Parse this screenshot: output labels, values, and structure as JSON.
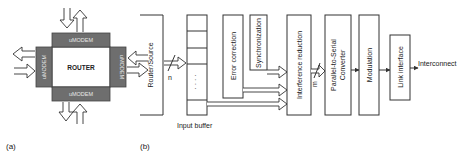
{
  "panel_a": {
    "label": "(a)",
    "router": "ROUTER",
    "modems": {
      "top": "uMODEM",
      "bottom": "uMODEM",
      "left": "uMODEM",
      "right": "uMODEM"
    }
  },
  "panel_b": {
    "label": "(b)",
    "source": "Router/Source",
    "bus_width_in": "n",
    "input_buffer": "Input buffer",
    "buffer_dots": "· · · ·",
    "blocks": {
      "error_correction": "Error correction",
      "synchronization": "Synchronization",
      "interference_reduction": "Interference reduction",
      "p2s": "Parallel-to-Serial",
      "p2s_2": "Converter",
      "modulation": "Modulation",
      "link_interface": "Link interface"
    },
    "bus_width_mid": "m",
    "output": "Interconnect"
  }
}
